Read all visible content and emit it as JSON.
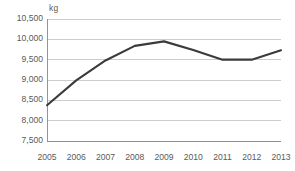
{
  "chart_data": {
    "type": "line",
    "title": "",
    "subtitle": "",
    "xlabel": "",
    "ylabel": "kg",
    "unit_label": "kg",
    "categories": [
      "2005",
      "2006",
      "2007",
      "2008",
      "2009",
      "2010",
      "2011",
      "2012",
      "2013"
    ],
    "x": [
      2005,
      2006,
      2007,
      2008,
      2009,
      2010,
      2011,
      2012,
      2013
    ],
    "values": [
      8380,
      8990,
      9480,
      9840,
      9950,
      9740,
      9500,
      9500,
      9730
    ],
    "series": [
      {
        "name": "kg",
        "values": [
          8380,
          8990,
          9480,
          9840,
          9950,
          9740,
          9500,
          9500,
          9730
        ],
        "color": "#3b3b3b"
      }
    ],
    "ylim": [
      7500,
      10500
    ],
    "yticks": [
      7500,
      8000,
      8500,
      9000,
      9500,
      10000,
      10500
    ],
    "ytick_labels": [
      "7,500",
      "8,000",
      "8,500",
      "9,000",
      "9,500",
      "10,000",
      "10,500"
    ],
    "xtick_labels": [
      "2005",
      "2006",
      "2007",
      "2008",
      "2009",
      "2010",
      "2011",
      "2012",
      "2013"
    ],
    "grid": true,
    "grid_axis": "y",
    "legend": false,
    "legend_position": "none",
    "colors": {
      "series": "#3b3b3b",
      "gridline": "#b8b8b8",
      "axis": "#8a8a8a",
      "tick_label": "#5a5a5a",
      "background": "#ffffff"
    }
  }
}
